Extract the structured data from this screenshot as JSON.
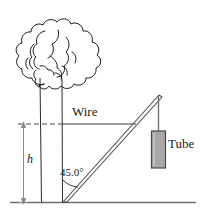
{
  "figure": {
    "name": "wire-tree-tube-diagram",
    "labels": {
      "wire": "Wire",
      "tube": "Tube",
      "angle": "45.0°",
      "height": "h"
    },
    "colors": {
      "line": "#1a1a1a",
      "ground": "#6e6e6e",
      "tube_fill": "#a8a8a8",
      "tube_stroke": "#4a4a4a",
      "dimension": "#7a7a7a",
      "background": "#ffffff"
    },
    "geometry": {
      "angle_degrees": "45.0",
      "ground_y": 202,
      "wire_y": 124,
      "apex": "157,95",
      "base": "63,202"
    }
  }
}
